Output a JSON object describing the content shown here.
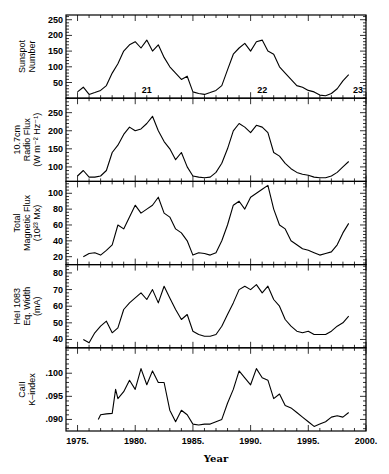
{
  "chart_data": {
    "type": "line",
    "layout": "5 vertically stacked panels sharing x-axis",
    "xlabel": "Year",
    "xlim": [
      1974,
      2000
    ],
    "xticks": [
      1975,
      1980,
      1985,
      1990,
      1995,
      2000
    ],
    "xtick_labels": [
      "1975.",
      "1980.",
      "1985.",
      "1990.",
      "1995.",
      "2000."
    ],
    "grid": false,
    "panels": [
      {
        "ylabel": [
          "Sunspot",
          "Number"
        ],
        "ylim": [
          0,
          265
        ],
        "yticks": [
          50,
          100,
          150,
          200,
          250
        ],
        "ytick_labels": [
          "50",
          "100",
          "150",
          "200",
          "250"
        ],
        "annotations": [
          {
            "text": "21",
            "x": 1981.0,
            "y": 15
          },
          {
            "text": "22",
            "x": 1991.0,
            "y": 15
          },
          {
            "text": "23",
            "x": 1999.3,
            "y": 15
          }
        ],
        "series": [
          {
            "name": "Sunspot Number",
            "x": [
              1975.0,
              1975.5,
              1976.0,
              1976.5,
              1977.0,
              1977.5,
              1978.0,
              1978.5,
              1979.0,
              1979.5,
              1980.0,
              1980.5,
              1981.0,
              1981.5,
              1982.0,
              1982.5,
              1983.0,
              1983.5,
              1984.0,
              1984.5,
              1985.0,
              1985.5,
              1986.0,
              1986.5,
              1987.0,
              1987.5,
              1988.0,
              1988.5,
              1989.0,
              1989.5,
              1990.0,
              1990.5,
              1991.0,
              1991.5,
              1992.0,
              1992.5,
              1993.0,
              1993.5,
              1994.0,
              1994.5,
              1995.0,
              1995.5,
              1996.0,
              1996.5,
              1997.0,
              1997.5,
              1998.0,
              1998.5
            ],
            "y": [
              20,
              35,
              12,
              18,
              25,
              40,
              80,
              110,
              150,
              170,
              180,
              160,
              185,
              150,
              170,
              130,
              100,
              80,
              60,
              70,
              20,
              15,
              12,
              18,
              25,
              40,
              90,
              140,
              160,
              175,
              150,
              180,
              185,
              150,
              140,
              100,
              80,
              60,
              40,
              35,
              25,
              20,
              10,
              8,
              15,
              30,
              55,
              75
            ]
          }
        ]
      },
      {
        "ylabel": [
          "10.7cm",
          "Radio Flux",
          "(W m⁻² Hz⁻¹)"
        ],
        "ylim": [
          60,
          290
        ],
        "yticks": [
          100,
          150,
          200,
          250
        ],
        "ytick_labels": [
          "100",
          "150",
          "200",
          "250"
        ],
        "series": [
          {
            "name": "10.7cm Radio Flux",
            "x": [
              1975.0,
              1975.5,
              1976.0,
              1976.5,
              1977.0,
              1977.5,
              1978.0,
              1978.5,
              1979.0,
              1979.5,
              1980.0,
              1980.5,
              1981.0,
              1981.5,
              1982.0,
              1982.5,
              1983.0,
              1983.5,
              1984.0,
              1984.5,
              1985.0,
              1985.5,
              1986.0,
              1986.5,
              1987.0,
              1987.5,
              1988.0,
              1988.5,
              1989.0,
              1989.5,
              1990.0,
              1990.5,
              1991.0,
              1991.5,
              1992.0,
              1992.5,
              1993.0,
              1993.5,
              1994.0,
              1994.5,
              1995.0,
              1995.5,
              1996.0,
              1996.5,
              1997.0,
              1997.5,
              1998.0,
              1998.5
            ],
            "y": [
              75,
              90,
              72,
              72,
              75,
              90,
              140,
              160,
              190,
              210,
              200,
              205,
              220,
              240,
              200,
              170,
              150,
              120,
              140,
              100,
              75,
              72,
              70,
              72,
              85,
              110,
              150,
              200,
              220,
              210,
              195,
              215,
              210,
              195,
              140,
              130,
              110,
              95,
              85,
              80,
              77,
              72,
              70,
              70,
              75,
              85,
              100,
              115
            ]
          }
        ]
      },
      {
        "ylabel": [
          "Total",
          "Magnetic Flux",
          "(10²³ Mx)"
        ],
        "ylim": [
          10,
          115
        ],
        "yticks": [
          20,
          40,
          60,
          80,
          100
        ],
        "ytick_labels": [
          "20",
          "40",
          "60",
          "80",
          "100"
        ],
        "series": [
          {
            "name": "Total Magnetic Flux",
            "x": [
              1975.5,
              1976.0,
              1976.5,
              1977.0,
              1977.5,
              1978.0,
              1978.5,
              1979.0,
              1979.5,
              1980.0,
              1980.5,
              1981.0,
              1981.5,
              1982.0,
              1982.5,
              1983.0,
              1983.5,
              1984.0,
              1984.5,
              1985.0,
              1985.5,
              1986.0,
              1986.5,
              1987.0,
              1987.5,
              1988.0,
              1988.5,
              1989.0,
              1989.5,
              1990.0,
              1990.5,
              1991.0,
              1991.5,
              1992.0,
              1992.5,
              1993.0,
              1993.5,
              1994.0,
              1994.5,
              1995.0,
              1995.5,
              1996.0,
              1996.5,
              1997.0,
              1997.5,
              1998.0,
              1998.5
            ],
            "y": [
              20,
              24,
              25,
              22,
              28,
              35,
              60,
              55,
              70,
              85,
              75,
              80,
              85,
              95,
              75,
              70,
              55,
              50,
              40,
              22,
              25,
              24,
              22,
              25,
              40,
              60,
              85,
              90,
              80,
              95,
              100,
              105,
              110,
              80,
              60,
              55,
              40,
              35,
              30,
              28,
              25,
              22,
              24,
              26,
              35,
              50,
              62
            ]
          }
        ]
      },
      {
        "ylabel": [
          "HeI 1083",
          "Eq. Width",
          "(mA)"
        ],
        "ylim": [
          35,
          85
        ],
        "yticks": [
          40,
          50,
          60,
          70,
          80
        ],
        "ytick_labels": [
          "40",
          "50",
          "60",
          "70",
          "80"
        ],
        "series": [
          {
            "name": "HeI 1083 Eq. Width",
            "x": [
              1975.5,
              1976.0,
              1976.5,
              1977.0,
              1977.5,
              1978.0,
              1978.5,
              1979.0,
              1979.5,
              1980.0,
              1980.5,
              1981.0,
              1981.5,
              1982.0,
              1982.5,
              1983.0,
              1983.5,
              1984.0,
              1984.5,
              1985.0,
              1985.5,
              1986.0,
              1986.5,
              1987.0,
              1987.5,
              1988.0,
              1988.5,
              1989.0,
              1989.5,
              1990.0,
              1990.5,
              1991.0,
              1991.5,
              1992.0,
              1992.5,
              1993.0,
              1993.5,
              1994.0,
              1994.5,
              1995.0,
              1995.5,
              1996.0,
              1996.5,
              1997.0,
              1997.5,
              1998.0,
              1998.5
            ],
            "y": [
              40,
              38,
              44,
              48,
              51,
              44,
              47,
              58,
              62,
              65,
              68,
              64,
              70,
              62,
              72,
              65,
              58,
              52,
              55,
              45,
              43,
              42,
              42,
              43,
              48,
              55,
              62,
              70,
              72,
              70,
              73,
              68,
              72,
              64,
              60,
              52,
              48,
              45,
              44,
              45,
              43,
              43,
              43,
              45,
              48,
              50,
              54
            ]
          }
        ]
      },
      {
        "ylabel": [
          "CaII",
          "K–index"
        ],
        "ylim": [
          0.0875,
          0.1055
        ],
        "yticks": [
          0.09,
          0.095,
          0.1
        ],
        "ytick_labels": [
          ".090",
          ".095",
          ".100"
        ],
        "series": [
          {
            "name": "CaII K-index",
            "x": [
              1976.8,
              1977.0,
              1977.5,
              1978.0,
              1978.3,
              1978.5,
              1979.0,
              1979.5,
              1980.0,
              1980.5,
              1981.0,
              1981.5,
              1982.0,
              1982.5,
              1983.0,
              1983.5,
              1984.0,
              1984.5,
              1985.0,
              1985.5,
              1986.0,
              1986.5,
              1987.0,
              1987.5,
              1988.0,
              1988.5,
              1989.0,
              1989.5,
              1990.0,
              1990.5,
              1991.0,
              1991.5,
              1992.0,
              1992.5,
              1993.0,
              1993.5,
              1994.0,
              1994.5,
              1995.0,
              1995.5,
              1996.0,
              1996.5,
              1997.0,
              1997.5,
              1998.0,
              1998.5
            ],
            "y": [
              0.09,
              0.091,
              0.0912,
              0.0913,
              0.0965,
              0.0945,
              0.096,
              0.0985,
              0.0965,
              0.101,
              0.0975,
              0.1005,
              0.098,
              0.098,
              0.092,
              0.0895,
              0.092,
              0.091,
              0.089,
              0.0888,
              0.089,
              0.089,
              0.0895,
              0.09,
              0.0935,
              0.0965,
              0.1005,
              0.099,
              0.0975,
              0.101,
              0.099,
              0.0985,
              0.0945,
              0.0955,
              0.093,
              0.0925,
              0.0915,
              0.0905,
              0.0895,
              0.0885,
              0.089,
              0.0895,
              0.0905,
              0.0908,
              0.0905,
              0.0915
            ]
          }
        ]
      }
    ]
  }
}
